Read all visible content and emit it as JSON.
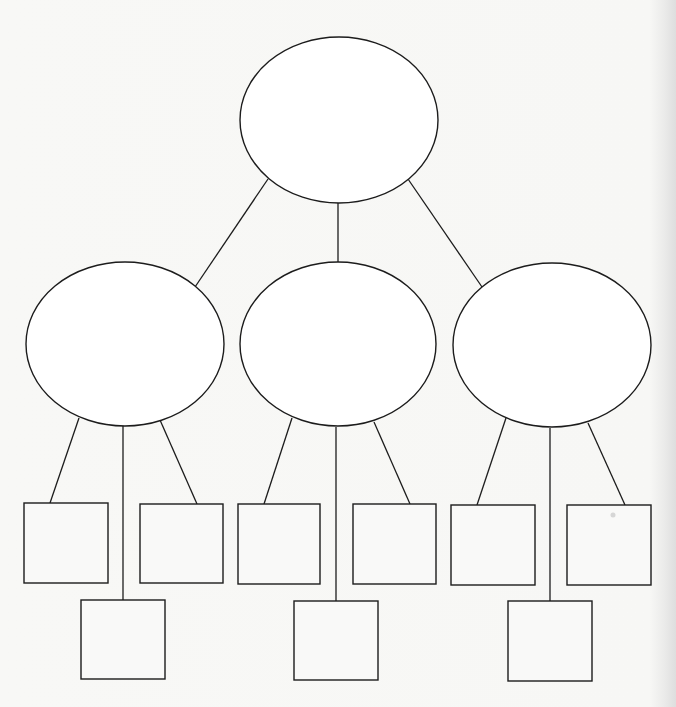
{
  "diagram": {
    "type": "tree-hierarchy-blank-template",
    "colors": {
      "stroke": "#1c1c1c",
      "background": "#f7f7f5",
      "node_fill": "#ffffff"
    },
    "root": {
      "shape": "ellipse",
      "label": "",
      "cx": 339,
      "cy": 120,
      "rx": 99,
      "ry": 83
    },
    "branches": [
      {
        "name": "left",
        "label": "",
        "ellipse": {
          "cx": 125,
          "cy": 344,
          "rx": 99,
          "ry": 82
        },
        "root_edge": {
          "x1": 268,
          "y1": 179,
          "x2": 195,
          "y2": 287
        },
        "leaves": [
          {
            "label": "",
            "x": 24,
            "y": 503,
            "w": 84,
            "h": 80,
            "edge": {
              "x1": 79,
              "y1": 418,
              "x2": 50,
              "y2": 503
            }
          },
          {
            "label": "",
            "x": 140,
            "y": 504,
            "w": 83,
            "h": 79,
            "edge": {
              "x1": 160,
              "y1": 420,
              "x2": 197,
              "y2": 504
            }
          },
          {
            "label": "",
            "x": 81,
            "y": 600,
            "w": 84,
            "h": 79,
            "edge": {
              "x1": 123,
              "y1": 426,
              "x2": 123,
              "y2": 600
            }
          }
        ]
      },
      {
        "name": "center",
        "label": "",
        "ellipse": {
          "cx": 338,
          "cy": 344,
          "rx": 98,
          "ry": 82
        },
        "root_edge": {
          "x1": 338,
          "y1": 202,
          "x2": 338,
          "y2": 262
        },
        "leaves": [
          {
            "label": "",
            "x": 238,
            "y": 504,
            "w": 82,
            "h": 80,
            "edge": {
              "x1": 292,
              "y1": 418,
              "x2": 264,
              "y2": 504
            }
          },
          {
            "label": "",
            "x": 353,
            "y": 504,
            "w": 83,
            "h": 80,
            "edge": {
              "x1": 374,
              "y1": 422,
              "x2": 410,
              "y2": 504
            }
          },
          {
            "label": "",
            "x": 294,
            "y": 601,
            "w": 84,
            "h": 79,
            "edge": {
              "x1": 336,
              "y1": 427,
              "x2": 336,
              "y2": 601
            }
          }
        ]
      },
      {
        "name": "right",
        "label": "",
        "ellipse": {
          "cx": 552,
          "cy": 345,
          "rx": 99,
          "ry": 82
        },
        "root_edge": {
          "x1": 408,
          "y1": 179,
          "x2": 482,
          "y2": 287
        },
        "leaves": [
          {
            "label": "",
            "x": 451,
            "y": 505,
            "w": 84,
            "h": 80,
            "edge": {
              "x1": 506,
              "y1": 418,
              "x2": 477,
              "y2": 505
            }
          },
          {
            "label": "",
            "x": 567,
            "y": 505,
            "w": 84,
            "h": 80,
            "edge": {
              "x1": 588,
              "y1": 423,
              "x2": 625,
              "y2": 505
            }
          },
          {
            "label": "",
            "x": 508,
            "y": 601,
            "w": 84,
            "h": 80,
            "edge": {
              "x1": 550,
              "y1": 428,
              "x2": 550,
              "y2": 601
            }
          }
        ]
      }
    ],
    "artifacts": [
      {
        "name": "ink-speck",
        "cx": 613,
        "cy": 515,
        "r": 2.5
      }
    ]
  }
}
